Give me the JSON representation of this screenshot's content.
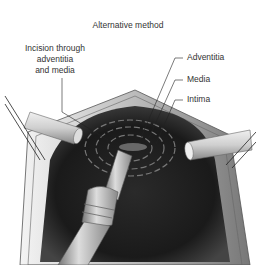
{
  "figure": {
    "title": "Alternative method",
    "labels": {
      "incision_line1": "Incision through",
      "incision_line2": "adventitia",
      "incision_line3": "and media",
      "adventitia": "Adventitia",
      "media": "Media",
      "intima": "Intima"
    }
  }
}
